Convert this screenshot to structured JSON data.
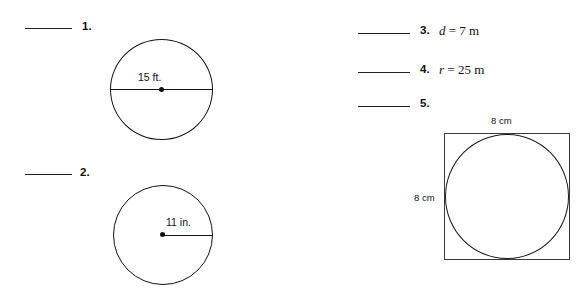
{
  "page": {
    "background_color": "#ffffff",
    "ink_color": "#111111"
  },
  "left_column": {
    "problems": [
      {
        "number": "1.",
        "blank_label": "answer-blank",
        "figure": {
          "type": "circle-with-diameter",
          "measure_label": "15 ft.",
          "value": 15,
          "unit": "ft.",
          "measure_kind": "diameter"
        }
      },
      {
        "number": "2.",
        "blank_label": "answer-blank",
        "figure": {
          "type": "circle-with-radius",
          "measure_label": "11 in.",
          "value": 11,
          "unit": "in.",
          "measure_kind": "radius"
        }
      }
    ]
  },
  "right_column": {
    "problems": [
      {
        "number": "3.",
        "expression_var": "d",
        "expression_rest": " = 7 m",
        "value": 7,
        "unit": "m"
      },
      {
        "number": "4.",
        "expression_var": "r",
        "expression_rest": " = 25 m",
        "value": 25,
        "unit": "m"
      },
      {
        "number": "5.",
        "expression_var": "",
        "expression_rest": "",
        "figure": {
          "type": "square-with-inscribed-circle",
          "top_label": "8 cm",
          "left_label": "8 cm",
          "side_value": 8,
          "unit": "cm"
        }
      }
    ]
  }
}
